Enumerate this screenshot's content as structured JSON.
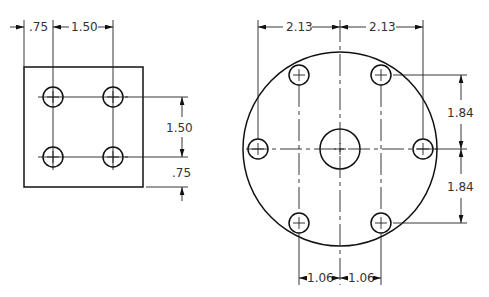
{
  "drawing": {
    "left_view": {
      "name": "square-plate",
      "dimensions": {
        "top_edge_offset": ".75",
        "top_hole_spacing": "1.50",
        "right_hole_spacing": "1.50",
        "right_edge_offset": ".75"
      },
      "holes": 4
    },
    "right_view": {
      "name": "circular-flange",
      "dimensions": {
        "top_left": "2.13",
        "top_right": "2.13",
        "right_upper": "1.84",
        "right_lower": "1.84",
        "bottom_left": "1.06",
        "bottom_right": "1.06"
      },
      "holes": 6,
      "center_hole": 1
    },
    "colors": {
      "line": "#111111",
      "text": "#333333",
      "background": "#ffffff"
    }
  }
}
